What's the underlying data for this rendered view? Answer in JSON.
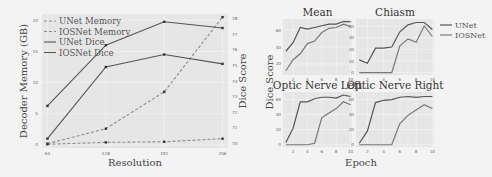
{
  "chart_data": [
    {
      "type": "line",
      "title": "",
      "xlabel": "Resolution",
      "ylabel": "Decoder Memory (GB)",
      "y2label": "Dice Score",
      "x": [
        64,
        128,
        192,
        256
      ],
      "x_tick_labels": [
        "64",
        "128",
        "192",
        "256"
      ],
      "ylim": [
        -0.5,
        21
      ],
      "y_ticks": [
        0,
        5,
        10,
        15,
        20
      ],
      "y2lim": [
        69.7,
        78.3
      ],
      "y2_ticks": [
        70,
        71,
        72,
        73,
        74,
        75,
        76,
        77,
        78
      ],
      "grid": true,
      "legend_position": "upper left",
      "series": [
        {
          "name": "UNet Memory",
          "axis": "left",
          "style": "dashed",
          "values": [
            0.2,
            2.6,
            8.5,
            20.5
          ]
        },
        {
          "name": "IOSNet Memory",
          "axis": "left",
          "style": "dashed",
          "values": [
            0.1,
            0.4,
            0.5,
            1.0
          ]
        },
        {
          "name": "UNet Dice",
          "axis": "right",
          "style": "solid",
          "values": [
            72.4,
            76.3,
            77.8,
            77.4
          ]
        },
        {
          "name": "IOSNet Dice",
          "axis": "right",
          "style": "solid",
          "values": [
            70.3,
            74.9,
            75.7,
            75.1
          ]
        }
      ]
    },
    {
      "type": "line",
      "layout": "2x2 subplots",
      "xlabel": "Epoch",
      "ylabel": "Dice Score",
      "x": [
        1,
        2,
        3,
        4,
        5,
        6,
        7,
        8,
        9,
        10
      ],
      "x_ticks": [
        2,
        4,
        6,
        8,
        10
      ],
      "legend": [
        "UNet",
        "IOSNet"
      ],
      "legend_position": "right of top-right subplot",
      "subplots": [
        {
          "title": "Mean",
          "y_ticks": [
            20,
            40,
            60
          ],
          "ylim": [
            7,
            73
          ],
          "series": [
            {
              "name": "UNet",
              "values": [
                35,
                45,
                63,
                61,
                63,
                65,
                67,
                67,
                70,
                70
              ]
            },
            {
              "name": "IOSNet",
              "values": [
                12,
                25,
                32,
                44,
                47,
                57,
                62,
                63,
                67,
                64
              ]
            }
          ]
        },
        {
          "title": "Chiasm",
          "y_ticks": [
            0,
            10,
            20,
            30,
            40
          ],
          "ylim": [
            -2,
            46
          ],
          "series": [
            {
              "name": "UNet",
              "values": [
                11,
                8,
                21,
                21,
                22,
                35,
                41,
                43,
                43,
                37
              ]
            },
            {
              "name": "IOSNet",
              "values": [
                0,
                0,
                0,
                0,
                0,
                23,
                29,
                26,
                40,
                31
              ]
            }
          ]
        },
        {
          "title": "Optic Nerve Left",
          "y_ticks": [
            0,
            20,
            40,
            60
          ],
          "ylim": [
            -3,
            70
          ],
          "series": [
            {
              "name": "UNet",
              "values": [
                3,
                22,
                57,
                57,
                61,
                63,
                63,
                62,
                66,
                64
              ]
            },
            {
              "name": "IOSNet",
              "values": [
                0,
                0,
                0,
                0,
                2,
                36,
                42,
                48,
                57,
                53
              ]
            }
          ]
        },
        {
          "title": "Optic Nerve Right",
          "y_ticks": [
            0,
            20,
            40,
            60
          ],
          "ylim": [
            -3,
            70
          ],
          "series": [
            {
              "name": "UNet",
              "values": [
                2,
                18,
                56,
                59,
                60,
                63,
                64,
                63,
                64,
                64
              ]
            },
            {
              "name": "IOSNet",
              "values": [
                0,
                0,
                0,
                0,
                0,
                28,
                39,
                46,
                53,
                48
              ]
            }
          ]
        }
      ]
    }
  ],
  "colors": {
    "line_dark": "#555555",
    "line_light": "#777777",
    "dashed": "#8a8a8a",
    "plot_bg": "#e6e6e6"
  }
}
